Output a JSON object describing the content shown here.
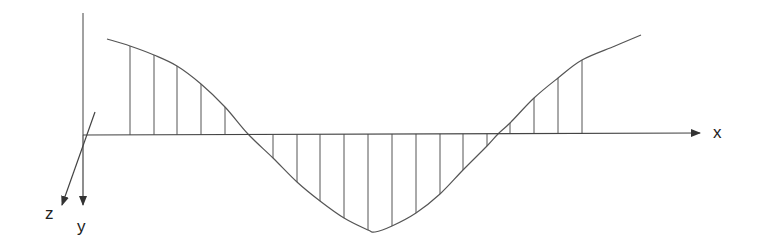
{
  "diagram": {
    "type": "beam-moment-distribution-sketch",
    "stroke_color": "#555555",
    "axes": {
      "x": {
        "label": "x",
        "origin": [
          83,
          135
        ],
        "end": [
          700,
          133
        ]
      },
      "y": {
        "label": "y",
        "top": [
          83,
          13
        ],
        "arrow_tip": [
          83,
          205
        ]
      },
      "z": {
        "label": "z",
        "start": [
          95,
          112
        ],
        "arrow_tip": [
          62,
          205
        ]
      }
    },
    "curve": {
      "points": [
        [
          107,
          39
        ],
        [
          130,
          46
        ],
        [
          154,
          55
        ],
        [
          177,
          66
        ],
        [
          201,
          84
        ],
        [
          225,
          107
        ],
        [
          248,
          134
        ],
        [
          273,
          158
        ],
        [
          297,
          182
        ],
        [
          320,
          201
        ],
        [
          344,
          218
        ],
        [
          368,
          230
        ],
        [
          375,
          232
        ],
        [
          392,
          226
        ],
        [
          416,
          213
        ],
        [
          440,
          194
        ],
        [
          463,
          170
        ],
        [
          487,
          146
        ],
        [
          498,
          134
        ],
        [
          510,
          123
        ],
        [
          534,
          98
        ],
        [
          558,
          78
        ],
        [
          582,
          60
        ],
        [
          615,
          46
        ],
        [
          641,
          35
        ]
      ]
    },
    "hatch_lines_x": [
      130,
      154,
      177,
      201,
      225,
      273,
      297,
      320,
      344,
      368,
      392,
      416,
      440,
      463,
      487,
      510,
      534,
      558,
      582
    ]
  },
  "labels": {
    "x": "x",
    "y": "y",
    "z": "z"
  }
}
